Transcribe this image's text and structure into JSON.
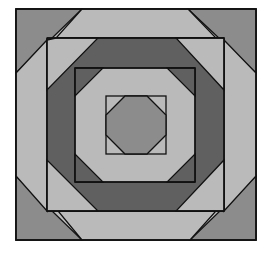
{
  "figure": {
    "colors": {
      "light": "#bababa",
      "medium": "#8c8c8c",
      "dark": "#606060",
      "stroke": "#111111",
      "background": "#ffffff"
    }
  }
}
